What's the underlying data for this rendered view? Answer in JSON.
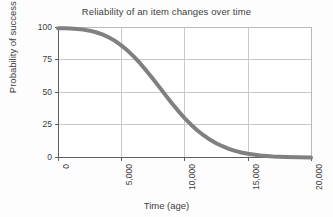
{
  "chart_data": {
    "type": "line",
    "title": "Reliability of an item changes over time",
    "xlabel": "Time (age)",
    "ylabel": "Probability of success (%)",
    "xlim": [
      0,
      20000
    ],
    "ylim": [
      0,
      100
    ],
    "xticks": [
      0,
      5000,
      10000,
      15000,
      20000
    ],
    "xtick_labels": [
      "0",
      "5,000",
      "10,000",
      "15,000",
      "20,000"
    ],
    "yticks": [
      0,
      25,
      50,
      75,
      100
    ],
    "ytick_labels": [
      "0",
      "25",
      "50",
      "75",
      "100"
    ],
    "grid": true,
    "grid_axes": "both",
    "legend": false,
    "series": [
      {
        "name": "Reliability",
        "color": "#808080",
        "linewidth": 4,
        "x": [
          0,
          500,
          1000,
          1500,
          2000,
          2500,
          3000,
          3500,
          4000,
          4500,
          5000,
          5500,
          6000,
          6500,
          7000,
          7500,
          8000,
          8500,
          9000,
          9500,
          10000,
          10500,
          11000,
          11500,
          12000,
          12500,
          13000,
          13500,
          14000,
          14500,
          15000,
          16000,
          17000,
          18000,
          19000,
          20000
        ],
        "values": [
          99,
          99,
          98.8,
          98.5,
          98,
          97.2,
          96,
          94.4,
          92.2,
          89.4,
          86,
          82,
          77.4,
          72.2,
          66.5,
          60.5,
          54.3,
          48,
          41.8,
          36,
          30.5,
          25.6,
          21.2,
          17.4,
          14.1,
          11.3,
          9,
          7,
          5.4,
          4.2,
          3.2,
          1.9,
          1.2,
          0.8,
          0.5,
          0.3
        ]
      }
    ]
  },
  "colors": {
    "curve": "#808080",
    "grid": "#c9c9c9",
    "axis": "#5f5f5f",
    "text": "#3d3d3d",
    "plot_background": "#ffffff",
    "figure_background": "#fdfdfd"
  }
}
